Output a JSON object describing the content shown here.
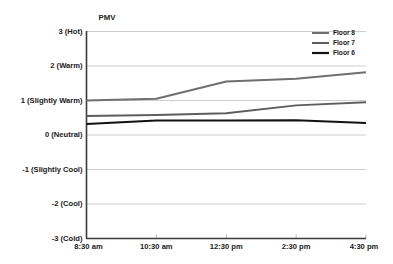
{
  "chart_data": {
    "type": "line",
    "title": "",
    "ylabel": "PMV",
    "xlabel": "",
    "x": [
      "8:30 am",
      "10:30 am",
      "12:30 pm",
      "2:30 pm",
      "4:30 pm"
    ],
    "ylim": [
      -3,
      3
    ],
    "yticks": [
      3,
      2,
      1,
      0,
      -1,
      -2,
      -3
    ],
    "ytick_labels": [
      "3 (Hot)",
      "2 (Warm)",
      "1 (Slightly Warm)",
      "0 (Neutral)",
      "-1 (Slightly Cool)",
      "-2 (Cool)",
      "-3 (Cold)"
    ],
    "grid": true,
    "legend_position": "top-right",
    "series": [
      {
        "name": "Floor 8",
        "color": "#6f6f6f",
        "values": [
          1.0,
          1.05,
          1.55,
          1.63,
          1.82
        ]
      },
      {
        "name": "Floor 7",
        "color": "#5e5e5e",
        "values": [
          0.55,
          0.58,
          0.63,
          0.86,
          0.95
        ]
      },
      {
        "name": "Floor 6",
        "color": "#111111",
        "values": [
          0.32,
          0.42,
          0.42,
          0.43,
          0.35
        ]
      }
    ]
  },
  "legend": {
    "items": [
      {
        "label": "Floor 8",
        "color": "#6f6f6f"
      },
      {
        "label": "Floor 7",
        "color": "#5e5e5e"
      },
      {
        "label": "Floor 6",
        "color": "#111111"
      }
    ]
  },
  "axes": {
    "y_title": "PMV"
  }
}
